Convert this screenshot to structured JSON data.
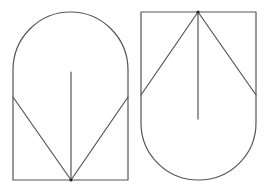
{
  "diagram": {
    "stroke_color": "#555555",
    "dot_color": "#222222",
    "background": "#ffffff",
    "figures": [
      {
        "name": "arch-up-figure",
        "outline": {
          "left": 13,
          "right": 128,
          "bottom": 180,
          "arc_top": 12,
          "arc_start_y": 70,
          "orientation": "arc-top"
        },
        "apex": {
          "x": 71,
          "y": 180
        },
        "diagonals": [
          {
            "from": [
              13,
              97
            ],
            "to": [
              71,
              180
            ]
          },
          {
            "from": [
              128,
              97
            ],
            "to": [
              71,
              180
            ]
          }
        ],
        "center_line": {
          "from": [
            71,
            72
          ],
          "to": [
            71,
            180
          ]
        }
      },
      {
        "name": "arch-down-figure",
        "outline": {
          "left": 141,
          "right": 256,
          "top": 12,
          "arc_bottom": 180,
          "arc_start_y": 123,
          "orientation": "arc-bottom"
        },
        "apex": {
          "x": 198,
          "y": 12
        },
        "diagonals": [
          {
            "from": [
              198,
              12
            ],
            "to": [
              141,
              95
            ]
          },
          {
            "from": [
              198,
              12
            ],
            "to": [
              256,
              95
            ]
          }
        ],
        "center_line": {
          "from": [
            198,
            12
          ],
          "to": [
            198,
            119
          ]
        }
      }
    ]
  }
}
